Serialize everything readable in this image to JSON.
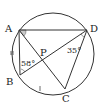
{
  "diagram": {
    "type": "circle-geometry",
    "circle": {
      "cx": 53,
      "cy": 54,
      "r": 41
    },
    "points": {
      "A": {
        "label": "A",
        "x": 19,
        "y": 30
      },
      "D": {
        "label": "D",
        "x": 87,
        "y": 30
      },
      "B": {
        "label": "B",
        "x": 20,
        "y": 75
      },
      "C": {
        "label": "C",
        "x": 65,
        "y": 89
      },
      "P": {
        "label": "P",
        "x": 43,
        "y": 60
      }
    },
    "angles": {
      "angle_ABD": {
        "label": "58°",
        "vertex": "B"
      },
      "angle_ADB": {
        "label": "35°",
        "vertex": "D"
      }
    },
    "segments": [
      "AD",
      "AB",
      "AC",
      "BD",
      "DC"
    ],
    "equal_marks": [
      "AB",
      "arc BC"
    ],
    "colors": {
      "stroke": "#333333",
      "label": "#222222",
      "angle_fill": "#c8c8c8"
    }
  }
}
